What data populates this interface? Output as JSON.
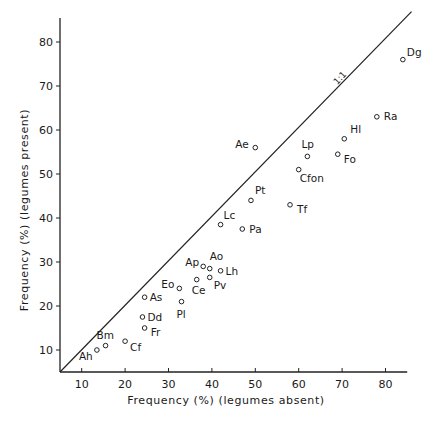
{
  "chart_data": {
    "type": "scatter",
    "title": "",
    "xlabel": "Frequency (%) (legumes absent)",
    "ylabel": "Frequency (%) (legumes present)",
    "xlim": [
      5,
      85
    ],
    "ylim": [
      5,
      85
    ],
    "x_ticks": [
      10,
      20,
      30,
      40,
      50,
      60,
      70,
      80
    ],
    "y_ticks": [
      10,
      20,
      30,
      40,
      50,
      60,
      70,
      80
    ],
    "grid": false,
    "legend": null,
    "reference_line": {
      "label": "1:1",
      "from": [
        5,
        5
      ],
      "to": [
        86,
        86
      ]
    },
    "points": [
      {
        "label": "Ah",
        "x": 13.5,
        "y": 10,
        "dx": -18,
        "dy": 10
      },
      {
        "label": "Bm",
        "x": 15.5,
        "y": 11,
        "dx": -9,
        "dy": -7
      },
      {
        "label": "Cf",
        "x": 20,
        "y": 12,
        "dx": 5,
        "dy": 10
      },
      {
        "label": "Fr",
        "x": 24.5,
        "y": 15,
        "dx": 6,
        "dy": 8
      },
      {
        "label": "Dd",
        "x": 24,
        "y": 17.5,
        "dx": 5,
        "dy": 4
      },
      {
        "label": "As",
        "x": 24.5,
        "y": 22,
        "dx": 5,
        "dy": 4
      },
      {
        "label": "Pl",
        "x": 33,
        "y": 21,
        "dx": -5,
        "dy": 16
      },
      {
        "label": "Eo",
        "x": 32.5,
        "y": 24,
        "dx": -18,
        "dy": 0
      },
      {
        "label": "Ce",
        "x": 36.5,
        "y": 26,
        "dx": -5,
        "dy": 14
      },
      {
        "label": "Pv",
        "x": 39.5,
        "y": 26.5,
        "dx": 4,
        "dy": 12
      },
      {
        "label": "Ap",
        "x": 38,
        "y": 29,
        "dx": -18,
        "dy": 0
      },
      {
        "label": "Ao",
        "x": 39.5,
        "y": 28.5,
        "dx": 0,
        "dy": -9
      },
      {
        "label": "Lh",
        "x": 42,
        "y": 28,
        "dx": 5,
        "dy": 4
      },
      {
        "label": "Lc",
        "x": 42,
        "y": 38.5,
        "dx": 3,
        "dy": -6
      },
      {
        "label": "Pa",
        "x": 47,
        "y": 37.5,
        "dx": 7,
        "dy": 4
      },
      {
        "label": "Pt",
        "x": 49,
        "y": 44,
        "dx": 4,
        "dy": -6
      },
      {
        "label": "Ae",
        "x": 50,
        "y": 56,
        "dx": -20,
        "dy": 0
      },
      {
        "label": "Tf",
        "x": 58,
        "y": 43,
        "dx": 7,
        "dy": 8
      },
      {
        "label": "Cfon",
        "x": 60,
        "y": 51,
        "dx": 1,
        "dy": 12
      },
      {
        "label": "Lp",
        "x": 62,
        "y": 54,
        "dx": -6,
        "dy": -8
      },
      {
        "label": "Fo",
        "x": 69,
        "y": 54.5,
        "dx": 6,
        "dy": 9
      },
      {
        "label": "Hl",
        "x": 70.5,
        "y": 58,
        "dx": 6,
        "dy": -6
      },
      {
        "label": "Ra",
        "x": 78,
        "y": 63,
        "dx": 7,
        "dy": 3
      },
      {
        "label": "Dg",
        "x": 84,
        "y": 76,
        "dx": 4,
        "dy": -4
      }
    ]
  }
}
